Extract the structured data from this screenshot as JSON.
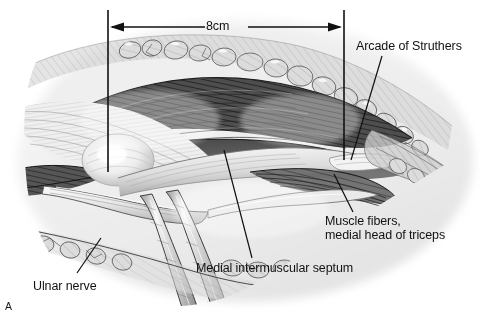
{
  "figure": {
    "letter": "A",
    "type": "surgical-anatomy-illustration",
    "style": "grayscale pen-and-ink medical illustration",
    "background_color": "#ffffff"
  },
  "dimension": {
    "label": "8cm",
    "arrow_style": "double-headed",
    "left_tick_x": 108,
    "right_tick_x": 344,
    "arrow_y": 27,
    "tick_top_y": 10,
    "left_tick_bottom_y": 172,
    "right_tick_bottom_y": 160
  },
  "labels": [
    {
      "id": "arcade-of-struthers",
      "text": "Arcade of Struthers",
      "lines": [
        "Arcade of Struthers"
      ],
      "x": 356,
      "y": 40,
      "align": "left",
      "leader": {
        "x1": 382,
        "y1": 56,
        "x2": 351,
        "y2": 160
      }
    },
    {
      "id": "muscle-fibers-triceps",
      "text": "Muscle fibers, medial head of triceps",
      "lines": [
        "Muscle fibers,",
        "medial head of triceps"
      ],
      "x": 325,
      "y": 215,
      "align": "left",
      "leader": {
        "x1": 334,
        "y1": 174,
        "x2": 353,
        "y2": 212
      }
    },
    {
      "id": "medial-intermuscular-septum",
      "text": "Medial intermuscular septum",
      "lines": [
        "Medial intermuscular septum"
      ],
      "x": 196,
      "y": 262,
      "align": "left",
      "leader": {
        "x1": 224,
        "y1": 150,
        "x2": 252,
        "y2": 258
      }
    },
    {
      "id": "ulnar-nerve",
      "text": "Ulnar nerve",
      "lines": [
        "Ulnar nerve"
      ],
      "x": 33,
      "y": 280,
      "align": "left",
      "leader": {
        "x1": 101,
        "y1": 238,
        "x2": 77,
        "y2": 273
      }
    }
  ],
  "colors": {
    "line": "#111111",
    "text": "#121212",
    "muscle_dark": "#4a4a4a",
    "muscle_mid": "#8f8f8f",
    "fat_light": "#d8d8d8",
    "tissue_pale": "#eeeeee",
    "background": "#ffffff"
  }
}
